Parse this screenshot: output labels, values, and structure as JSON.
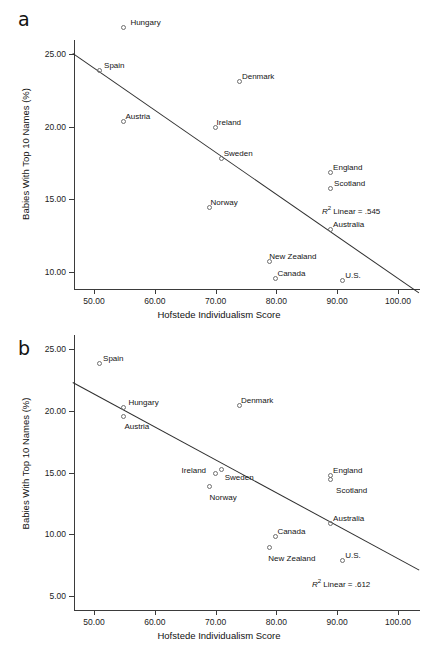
{
  "figure": {
    "panels": [
      {
        "letter": "a",
        "xlabel": "Hofstede Individualism Score",
        "ylabel": "Babies With Top 10 Names (%)",
        "xticks": [
          "50.00",
          "60.00",
          "70.00",
          "80.00",
          "90.00",
          "100.00"
        ],
        "yticks": [
          "25.00",
          "20.00",
          "15.00",
          "10.00"
        ],
        "r2_text": "Linear = .545",
        "r2_prefix": "R",
        "r2_exp": "2"
      },
      {
        "letter": "b",
        "xlabel": "Hofstede Individualism Score",
        "ylabel": "Babies With Top 10 Names (%)",
        "xticks": [
          "50.00",
          "60.00",
          "70.00",
          "80.00",
          "90.00",
          "100.00"
        ],
        "yticks": [
          "25.00",
          "20.00",
          "15.00",
          "10.00",
          "5.00"
        ],
        "r2_text": "Linear = .612",
        "r2_prefix": "R",
        "r2_exp": "2"
      }
    ]
  },
  "chart_data": [
    {
      "type": "scatter",
      "panel": "a",
      "title": "",
      "xlabel": "Hofstede Individualism Score",
      "ylabel": "Babies With Top 10 Names (%)",
      "xlim": [
        46.5,
        103.5
      ],
      "ylim": [
        8.2,
        27.6
      ],
      "xticks": [
        50,
        60,
        70,
        80,
        90,
        100
      ],
      "yticks": [
        25,
        20,
        15,
        10
      ],
      "grid": false,
      "legend": false,
      "annotation": "R2 Linear = .545",
      "r2": 0.545,
      "fit_line": {
        "x0": 46.5,
        "y0": 25.1,
        "x1": 103.5,
        "y1": 8.6
      },
      "points": [
        {
          "label": "Hungary",
          "x": 55.0,
          "y": 26.8,
          "label_dx": 6,
          "label_dy": -10
        },
        {
          "label": "Spain",
          "x": 51.0,
          "y": 23.8,
          "label_dx": 4,
          "label_dy": -10
        },
        {
          "label": "Denmark",
          "x": 74.0,
          "y": 23.1,
          "label_dx": 2,
          "label_dy": -10
        },
        {
          "label": "Austria",
          "x": 55.0,
          "y": 20.3,
          "label_dx": 1,
          "label_dy": -10
        },
        {
          "label": "Ireland",
          "x": 70.0,
          "y": 19.9,
          "label_dx": 1,
          "label_dy": -10
        },
        {
          "label": "Sweden",
          "x": 71.0,
          "y": 17.8,
          "label_dx": 2,
          "label_dy": -10
        },
        {
          "label": "England",
          "x": 89.0,
          "y": 16.8,
          "label_dx": 2,
          "label_dy": -10
        },
        {
          "label": "Scotland",
          "x": 89.0,
          "y": 15.7,
          "label_dx": 3,
          "label_dy": -10
        },
        {
          "label": "Norway",
          "x": 69.0,
          "y": 14.4,
          "label_dx": 1,
          "label_dy": -10
        },
        {
          "label": "Australia",
          "x": 89.0,
          "y": 12.9,
          "label_dx": 2,
          "label_dy": -10
        },
        {
          "label": "New Zealand",
          "x": 79.0,
          "y": 10.7,
          "label_dx": -1,
          "label_dy": -10
        },
        {
          "label": "Canada",
          "x": 80.0,
          "y": 9.5,
          "label_dx": 1,
          "label_dy": -10
        },
        {
          "label": "U.S.",
          "x": 91.0,
          "y": 9.4,
          "label_dx": 2,
          "label_dy": -10
        }
      ]
    },
    {
      "type": "scatter",
      "panel": "b",
      "title": "",
      "xlabel": "Hofstede Individualism Score",
      "ylabel": "Babies With Top 10 Names (%)",
      "xlim": [
        46.5,
        103.5
      ],
      "ylim": [
        3.6,
        25.6
      ],
      "xticks": [
        50,
        60,
        70,
        80,
        90,
        100
      ],
      "yticks": [
        25,
        20,
        15,
        10,
        5
      ],
      "grid": false,
      "legend": false,
      "annotation": "R2 Linear = .612",
      "r2": 0.612,
      "fit_line": {
        "x0": 46.5,
        "y0": 22.3,
        "x1": 103.5,
        "y1": 7.1
      },
      "points": [
        {
          "label": "Spain",
          "x": 51.0,
          "y": 23.8,
          "label_dx": 3,
          "label_dy": -10
        },
        {
          "label": "Hungary",
          "x": 55.0,
          "y": 20.2,
          "label_dx": 4,
          "label_dy": -10
        },
        {
          "label": "Denmark",
          "x": 74.0,
          "y": 20.4,
          "label_dx": 1,
          "label_dy": -10
        },
        {
          "label": "Austria",
          "x": 55.0,
          "y": 19.5,
          "label_dx": 0,
          "label_dy": 5
        },
        {
          "label": "Sweden",
          "x": 71.0,
          "y": 15.2,
          "label_dx": 3,
          "label_dy": 3
        },
        {
          "label": "Ireland",
          "x": 70.0,
          "y": 14.9,
          "label_dx": -34,
          "label_dy": -8
        },
        {
          "label": "England",
          "x": 89.0,
          "y": 14.7,
          "label_dx": 2,
          "label_dy": -10
        },
        {
          "label": "Scotland",
          "x": 89.0,
          "y": 14.4,
          "label_dx": 5,
          "label_dy": 6
        },
        {
          "label": "Norway",
          "x": 69.0,
          "y": 13.8,
          "label_dx": 0,
          "label_dy": 6
        },
        {
          "label": "Australia",
          "x": 89.0,
          "y": 10.8,
          "label_dx": 2,
          "label_dy": -10
        },
        {
          "label": "Canada",
          "x": 80.0,
          "y": 9.8,
          "label_dx": 1,
          "label_dy": -10
        },
        {
          "label": "New Zealand",
          "x": 79.0,
          "y": 8.9,
          "label_dx": -2,
          "label_dy": 6
        },
        {
          "label": "U.S.",
          "x": 91.0,
          "y": 7.8,
          "label_dx": 2,
          "label_dy": -10
        }
      ]
    }
  ]
}
